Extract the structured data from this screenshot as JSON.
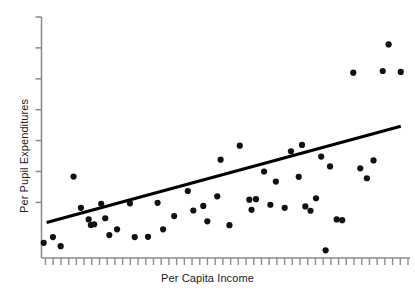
{
  "chart_data": {
    "type": "scatter",
    "title": "",
    "xlabel": "Per Capita Income",
    "ylabel": "Per Pupil Expenditures",
    "grid": false,
    "legend": null,
    "axis_tick_labels": {
      "x": [],
      "y": []
    },
    "xlim": [
      0,
      100
    ],
    "ylim": [
      0,
      100
    ],
    "x_tick_count": 48,
    "y_tick_count": 7,
    "points": [
      {
        "x": 0.6,
        "y": 6.3
      },
      {
        "x": 3.1,
        "y": 8.7
      },
      {
        "x": 5.2,
        "y": 4.9
      },
      {
        "x": 8.7,
        "y": 33.8
      },
      {
        "x": 10.7,
        "y": 20.8
      },
      {
        "x": 12.8,
        "y": 16.0
      },
      {
        "x": 13.4,
        "y": 13.7
      },
      {
        "x": 14.3,
        "y": 14.0
      },
      {
        "x": 16.2,
        "y": 22.5
      },
      {
        "x": 17.3,
        "y": 16.5
      },
      {
        "x": 18.4,
        "y": 9.5
      },
      {
        "x": 20.5,
        "y": 11.9
      },
      {
        "x": 24.0,
        "y": 22.7
      },
      {
        "x": 25.3,
        "y": 8.7
      },
      {
        "x": 28.9,
        "y": 8.8
      },
      {
        "x": 31.5,
        "y": 22.9
      },
      {
        "x": 33.0,
        "y": 11.9
      },
      {
        "x": 36.0,
        "y": 17.4
      },
      {
        "x": 39.7,
        "y": 27.8
      },
      {
        "x": 41.2,
        "y": 19.7
      },
      {
        "x": 43.9,
        "y": 21.6
      },
      {
        "x": 45.0,
        "y": 15.2
      },
      {
        "x": 47.7,
        "y": 25.6
      },
      {
        "x": 48.6,
        "y": 40.8
      },
      {
        "x": 51.0,
        "y": 13.6
      },
      {
        "x": 53.8,
        "y": 46.6
      },
      {
        "x": 56.4,
        "y": 24.2
      },
      {
        "x": 57.0,
        "y": 20.0
      },
      {
        "x": 58.2,
        "y": 24.4
      },
      {
        "x": 60.4,
        "y": 35.9
      },
      {
        "x": 62.1,
        "y": 22.1
      },
      {
        "x": 63.6,
        "y": 31.7
      },
      {
        "x": 66.0,
        "y": 20.8
      },
      {
        "x": 67.7,
        "y": 44.3
      },
      {
        "x": 69.8,
        "y": 33.7
      },
      {
        "x": 70.7,
        "y": 46.9
      },
      {
        "x": 71.6,
        "y": 21.4
      },
      {
        "x": 73.0,
        "y": 19.6
      },
      {
        "x": 74.5,
        "y": 24.8
      },
      {
        "x": 75.9,
        "y": 42.1
      },
      {
        "x": 77.1,
        "y": 3.2
      },
      {
        "x": 78.3,
        "y": 38.0
      },
      {
        "x": 80.1,
        "y": 16.0
      },
      {
        "x": 81.6,
        "y": 15.7
      },
      {
        "x": 84.6,
        "y": 76.9
      },
      {
        "x": 86.5,
        "y": 37.2
      },
      {
        "x": 88.3,
        "y": 33.1
      },
      {
        "x": 90.1,
        "y": 40.5
      },
      {
        "x": 92.6,
        "y": 77.6
      },
      {
        "x": 94.2,
        "y": 88.6
      },
      {
        "x": 97.5,
        "y": 77.2
      }
    ],
    "trendline": {
      "type": "linear",
      "x_start": 1.4,
      "y_start": 14.7,
      "x_end": 97.5,
      "y_end": 54.7,
      "color": "#000000"
    },
    "style": {
      "point_color": "#111111",
      "point_radius": 3.1,
      "axis_color": "#8e8e8e",
      "text_color": "#1b1b1b"
    }
  }
}
